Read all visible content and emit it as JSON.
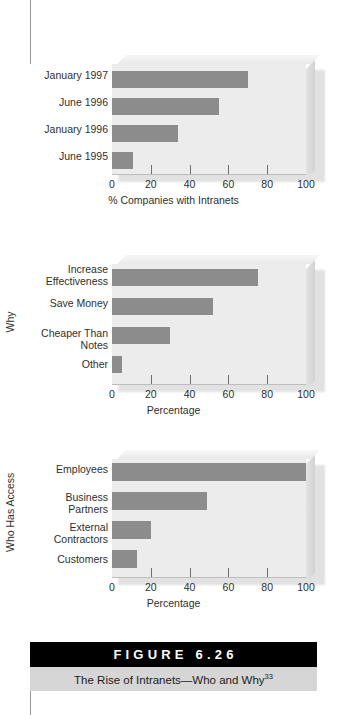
{
  "figure": {
    "banner_label": "FIGURE 6.26",
    "caption_text": "The Rise of Intranets—Who and Why",
    "caption_superscript": "33"
  },
  "charts": [
    {
      "id": "companies-with-intranets",
      "axis_title_y": "",
      "chart_data": {
        "type": "bar",
        "orientation": "horizontal",
        "title": "",
        "xlabel": "% Companies with Intranets",
        "ylabel": "",
        "categories": [
          "January 1997",
          "June 1996",
          "January 1996",
          "June 1995"
        ],
        "values": [
          70,
          55,
          34,
          11
        ],
        "xlim": [
          0,
          100
        ],
        "xticks": [
          0,
          20,
          40,
          60,
          80,
          100
        ],
        "ticklabels": [
          "0",
          "20",
          "40",
          "60",
          "80",
          "100"
        ],
        "grid": false,
        "legend": false,
        "series_color": "#8c8c8c"
      }
    },
    {
      "id": "why-intranets",
      "axis_title_y": "Why",
      "chart_data": {
        "type": "bar",
        "orientation": "horizontal",
        "title": "",
        "xlabel": "Percentage",
        "ylabel": "Why",
        "categories": [
          "Increase\nEffectiveness",
          "Save Money",
          "Cheaper Than\nNotes",
          "Other"
        ],
        "values": [
          75,
          52,
          30,
          5
        ],
        "xlim": [
          0,
          100
        ],
        "xticks": [
          0,
          20,
          40,
          60,
          80,
          100
        ],
        "ticklabels": [
          "0",
          "20",
          "40",
          "60",
          "80",
          "100"
        ],
        "grid": false,
        "legend": false,
        "series_color": "#8c8c8c"
      }
    },
    {
      "id": "who-has-access",
      "axis_title_y": "Who Has Access",
      "chart_data": {
        "type": "bar",
        "orientation": "horizontal",
        "title": "",
        "xlabel": "Percentage",
        "ylabel": "Who Has Access",
        "categories": [
          "Employees",
          "Business\nPartners",
          "External\nContractors",
          "Customers"
        ],
        "values": [
          100,
          49,
          20,
          13
        ],
        "xlim": [
          0,
          100
        ],
        "xticks": [
          0,
          20,
          40,
          60,
          80,
          100
        ],
        "ticklabels": [
          "0",
          "20",
          "40",
          "60",
          "80",
          "100"
        ],
        "grid": false,
        "legend": false,
        "series_color": "#8c8c8c"
      }
    }
  ],
  "colors": {
    "bar": "#8c8c8c",
    "plot_background": "#ececec",
    "banner_background": "#000000",
    "caption_background": "#d6d6d6",
    "text": "#2f2f2f"
  }
}
